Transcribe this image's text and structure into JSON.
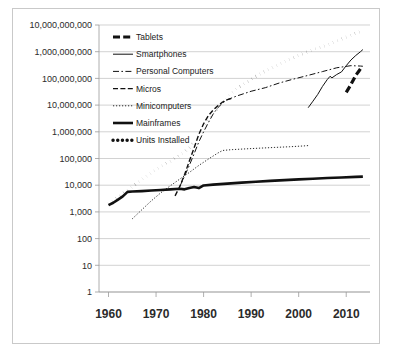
{
  "chart_data": {
    "type": "line",
    "title": "",
    "xlabel": "",
    "ylabel": "",
    "yscale": "log",
    "ylim": [
      1,
      10000000000
    ],
    "xlim": [
      1958,
      2015
    ],
    "grid": true,
    "legend_position": "top-left inside plot",
    "ytick_labels": [
      "10,000,000,000",
      "1,000,000,000",
      "100,000,000",
      "10,000,000",
      "1,000,000",
      "100,000",
      "10,000",
      "1,000",
      "100",
      "10",
      "1"
    ],
    "ytick_values": [
      10000000000,
      1000000000,
      100000000,
      10000000,
      1000000,
      100000,
      10000,
      1000,
      100,
      10,
      1
    ],
    "xtick_labels": [
      "1960",
      "1970",
      "1980",
      "1990",
      "2000",
      "2010"
    ],
    "xtick_values": [
      1960,
      1970,
      1980,
      1990,
      2000,
      2010
    ],
    "series": [
      {
        "name": "Tablets",
        "style": "thick-dash",
        "x": [
          2010,
          2010.6,
          2011,
          2011.6,
          2012,
          2012.6,
          2013,
          2013.5
        ],
        "values": [
          30000000,
          45000000,
          60000000,
          95000000,
          130000000,
          180000000,
          230000000,
          260000000
        ]
      },
      {
        "name": "Smartphones",
        "style": "thin-solid",
        "x": [
          2002,
          2003,
          2004,
          2005,
          2006,
          2006.6,
          2007,
          2008,
          2009,
          2010,
          2011,
          2012,
          2013,
          2013.5
        ],
        "values": [
          8000000,
          14000000,
          25000000,
          50000000,
          90000000,
          120000000,
          105000000,
          140000000,
          175000000,
          300000000,
          490000000,
          720000000,
          1000000000,
          1200000000
        ]
      },
      {
        "name": "Personal Computers",
        "style": "dash-dot",
        "x": [
          1975,
          1976,
          1977,
          1978,
          1979,
          1980,
          1981,
          1982,
          1983,
          1984,
          1985,
          1987,
          1990,
          1993,
          1996,
          1999,
          2002,
          2005,
          2008,
          2011,
          2013,
          2013.5
        ],
        "values": [
          9000,
          22000,
          55000,
          150000,
          420000,
          1000000,
          2200000,
          4600000,
          8000000,
          12000000,
          16000000,
          22000000,
          33000000,
          45000000,
          68000000,
          95000000,
          130000000,
          180000000,
          250000000,
          300000000,
          290000000,
          285000000
        ]
      },
      {
        "name": "Micros",
        "style": "med-dash",
        "x": [
          1974,
          1975,
          1976,
          1977,
          1978,
          1979,
          1980,
          1981,
          1982,
          1983,
          1984,
          1985,
          1986
        ],
        "values": [
          4000,
          9000,
          25000,
          80000,
          250000,
          800000,
          2000000,
          4000000,
          6500000,
          9500000,
          13000000,
          16000000,
          18000000
        ]
      },
      {
        "name": "Minicomputers",
        "style": "fine-dot",
        "x": [
          1965,
          1967,
          1969,
          1971,
          1973,
          1975,
          1977,
          1979,
          1981,
          1983,
          1984,
          1986,
          1989,
          1992,
          1995,
          1998,
          2001,
          2002
        ],
        "values": [
          550,
          1200,
          2600,
          5200,
          9500,
          17000,
          30000,
          55000,
          95000,
          160000,
          200000,
          215000,
          230000,
          245000,
          260000,
          275000,
          295000,
          305000
        ]
      },
      {
        "name": "Mainframes",
        "style": "thick-solid",
        "x": [
          1960,
          1961,
          1962,
          1963,
          1964,
          1965,
          1967,
          1969,
          1971,
          1973,
          1975,
          1976,
          1977,
          1978,
          1979,
          1980,
          1982,
          1985,
          1988,
          1991,
          1994,
          1997,
          2000,
          2003,
          2006,
          2009,
          2012,
          2013.5
        ],
        "values": [
          1800,
          2200,
          2900,
          3800,
          5600,
          5800,
          6000,
          6300,
          6600,
          7000,
          7400,
          7000,
          7900,
          8600,
          7800,
          9800,
          10500,
          11500,
          12500,
          13500,
          14500,
          15500,
          16500,
          17500,
          18500,
          19500,
          20500,
          21000
        ]
      },
      {
        "name": "Units Installed",
        "style": "thick-dot",
        "x": [
          1960,
          1962,
          1964,
          1966,
          1968,
          1970,
          1972,
          1974,
          1976,
          1978,
          1980,
          1982,
          1984,
          1986,
          1988,
          1990,
          1992,
          1994,
          1996,
          1998,
          2000,
          2002,
          2004,
          2006,
          2008,
          2010,
          2012,
          2013.5
        ],
        "values": [
          2000,
          3500,
          6500,
          12000,
          22000,
          38000,
          62000,
          100000,
          170000,
          400000,
          1500000,
          5000000,
          13000000,
          30000000,
          55000000,
          95000000,
          150000000,
          230000000,
          350000000,
          520000000,
          750000000,
          1000000000,
          1350000000,
          1800000000,
          2500000000,
          3500000000,
          5000000000,
          6000000000
        ]
      }
    ]
  },
  "legend": {
    "items": [
      {
        "label": "Tablets",
        "style": "thick-dash"
      },
      {
        "label": "Smartphones",
        "style": "thin-solid"
      },
      {
        "label": "Personal Computers",
        "style": "dash-dot"
      },
      {
        "label": "Micros",
        "style": "med-dash"
      },
      {
        "label": "Minicomputers",
        "style": "fine-dot"
      },
      {
        "label": "Mainframes",
        "style": "thick-solid"
      },
      {
        "label": "Units Installed",
        "style": "thick-dot"
      }
    ]
  },
  "colors": {
    "series": "#111111",
    "grid": "#bfbfbf",
    "axis": "#9a9a9a",
    "text": "#2b2b2b",
    "border": "#c9c9c9",
    "background": "#ffffff"
  }
}
